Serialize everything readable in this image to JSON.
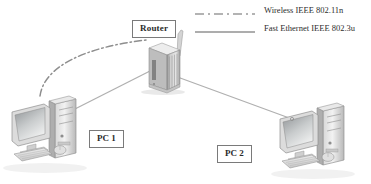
{
  "diagram": {
    "title_present": false,
    "background_color": "#ffffff",
    "line_color": "#9a9a9a",
    "label_border_color": "#7a7a7a",
    "text_color": "#2d2d2d"
  },
  "legend": {
    "items": [
      {
        "id": "wireless",
        "label": "Wireless IEEE 802.11n",
        "style": "dash-dot",
        "color": "#9a9a9a",
        "icon": "dash-dot-line-icon"
      },
      {
        "id": "ethernet",
        "label": "Fast Ethernet IEEE 802.3u",
        "style": "solid",
        "color": "#a8a8a8",
        "icon": "solid-line-icon"
      }
    ]
  },
  "nodes": [
    {
      "id": "router",
      "label": "Router",
      "icon": "router-icon",
      "type": "network-device"
    },
    {
      "id": "pc1",
      "label": "PC 1",
      "icon": "desktop-computer-icon",
      "type": "workstation"
    },
    {
      "id": "pc2",
      "label": "PC 2",
      "icon": "desktop-computer-icon",
      "type": "workstation"
    }
  ],
  "connections": [
    {
      "id": "pc1-router-wireless",
      "from": "pc1",
      "to": "router",
      "style": "dash-dot",
      "technology": "Wireless IEEE 802.11n"
    },
    {
      "id": "pc1-router-ethernet",
      "from": "pc1",
      "to": "router",
      "style": "solid",
      "technology": "Fast Ethernet IEEE 802.3u"
    },
    {
      "id": "router-pc2-ethernet",
      "from": "router",
      "to": "pc2",
      "style": "solid",
      "technology": "Fast Ethernet IEEE 802.3u"
    }
  ]
}
